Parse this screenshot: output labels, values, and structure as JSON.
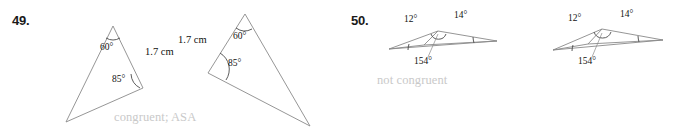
{
  "problems": [
    {
      "number": "49.",
      "answer": "congruent; ASA",
      "figures": [
        {
          "name": "triangle-left",
          "labels": {
            "angle_top": "60°",
            "angle_bottom": "85°",
            "side": "1.7 cm"
          }
        },
        {
          "name": "triangle-right",
          "labels": {
            "angle_top": "60°",
            "angle_bottom": "85°",
            "side": "1.7 cm"
          }
        }
      ]
    },
    {
      "number": "50.",
      "answer": "not congruent",
      "figures": [
        {
          "name": "triangle-left",
          "labels": {
            "angle_left": "12°",
            "angle_right": "14°",
            "angle_bottom": "154°"
          }
        },
        {
          "name": "triangle-right",
          "labels": {
            "angle_left": "12°",
            "angle_right": "14°",
            "angle_bottom": "154°"
          }
        }
      ]
    }
  ],
  "style": {
    "stroke_color": "#8a8a8a",
    "answer_color": "#c9c9c9",
    "text_color": "#111111",
    "background": "#ffffff"
  }
}
